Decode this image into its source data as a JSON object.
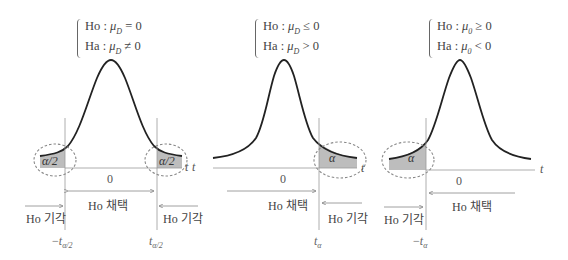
{
  "panels": [
    {
      "name": "two-tailed",
      "hypothesis": {
        "h0_label": "Ho",
        "h0_rel": "= 0",
        "ha_label": "Ha",
        "ha_rel": "≠ 0",
        "param": "μ",
        "param_sub": "D"
      },
      "alpha_label_left": "α/2",
      "alpha_label_right": "α/2",
      "zero": "0",
      "axis": "t",
      "accept": "Ho 채택",
      "reject_left": "Ho 기각",
      "reject_right": "Ho 기각",
      "crit_left": {
        "sign": "−",
        "var": "t",
        "sub": "α/2"
      },
      "crit_right": {
        "sign": "",
        "var": "t",
        "sub": "α/2"
      }
    },
    {
      "name": "right-tailed",
      "hypothesis": {
        "h0_label": "Ho",
        "h0_rel": "≤ 0",
        "ha_label": "Ha",
        "ha_rel": "> 0",
        "param": "μ",
        "param_sub": "D"
      },
      "alpha_label": "α",
      "zero": "0",
      "axis_left": "t",
      "axis": "t",
      "accept": "Ho 채택",
      "reject": "Ho 기각",
      "crit": {
        "sign": "",
        "var": "t",
        "sub": "α"
      }
    },
    {
      "name": "left-tailed",
      "hypothesis": {
        "h0_label": "Ho",
        "h0_rel": "≥ 0",
        "ha_label": "Ha",
        "ha_rel": "< 0",
        "param": "μ",
        "param_sub": "0"
      },
      "alpha_label": "α",
      "zero": "0",
      "axis": "t",
      "accept": "Ho 채택",
      "reject": "Ho 기각",
      "crit": {
        "sign": "−",
        "var": "t",
        "sub": "α"
      }
    }
  ],
  "colors": {
    "curve": "#222222",
    "axis": "#999999",
    "shade": "#bdbdbd",
    "ellipse": "#888888",
    "arrow": "#888888"
  }
}
